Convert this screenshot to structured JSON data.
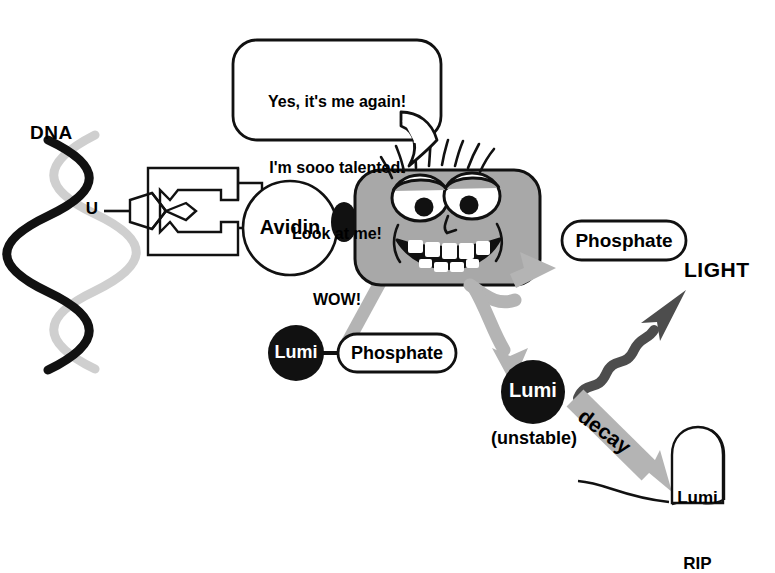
{
  "figure": {
    "colors": {
      "ink": "#111111",
      "enzyme_body": "#a8a8a8",
      "arrow_gray": "#b4b4b4",
      "light_arrow": "#4d4d4d",
      "dna_strand_dark": "#111111",
      "dna_strand_light": "#cfcfcf",
      "lumi_fill": "#111111",
      "lumi_text": "#ffffff"
    }
  },
  "speech_bubble": {
    "name": "enzyme-speech-bubble",
    "lines": [
      "Yes, it's me again!",
      "I'm sooo talented.",
      "Look at me!",
      "WOW!"
    ]
  },
  "dna": {
    "label": "DNA",
    "base_label": "U"
  },
  "avidin": {
    "label": "Avidin"
  },
  "substrate": {
    "lumi_label": "Lumi",
    "phosphate_label": "Phosphate"
  },
  "products": {
    "phosphate_label": "Phosphate",
    "lumi_label": "Lumi",
    "lumi_state": "(unstable)",
    "light_label": "LIGHT",
    "decay_label": "decay"
  },
  "tombstone": {
    "line1": "Lumi",
    "line2": "RIP"
  }
}
